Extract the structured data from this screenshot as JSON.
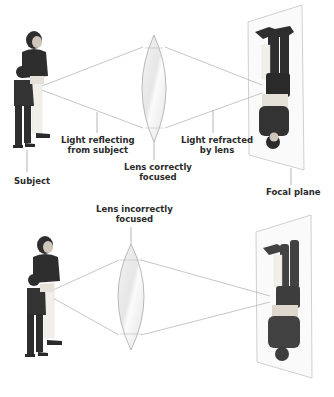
{
  "top_panel": {
    "subject_label": "Subject",
    "light_reflecting_label_line1": "Light reflecting",
    "light_reflecting_label_line2": "from subject",
    "lens_label_line1": "Lens correctly",
    "lens_label_line2": "focused",
    "light_refracted_label_line1": "Light refracted",
    "light_refracted_label_line2": "by lens",
    "focal_plane_label": "Focal plane"
  },
  "bottom_panel": {
    "lens_label_line1": "Lens incorrectly",
    "lens_label_line2": "focused"
  },
  "colors": {
    "ray_line": "#b8b8b8",
    "lens_fill": "#eeeeee",
    "lens_edge": "#a8a8a8",
    "plane_fill": "#fafafa",
    "plane_edge": "#c4c4c4",
    "figure_dark": "#2e2e2e",
    "figure_light": "#f2efe8",
    "label_text": "#2a2a2a"
  }
}
